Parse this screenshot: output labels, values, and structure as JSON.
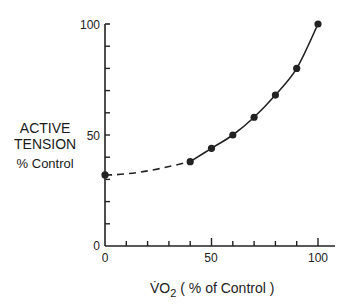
{
  "chart_data": {
    "type": "line",
    "title": "",
    "xlabel": "V̇O2 (% of Control)",
    "ylabel": "ACTIVE TENSION % Control",
    "xlim": [
      0,
      100
    ],
    "ylim": [
      0,
      100
    ],
    "x_ticks": [
      0,
      50,
      100
    ],
    "y_ticks": [
      0,
      50,
      100
    ],
    "grid": false,
    "series": [
      {
        "name": "Active tension vs VO2",
        "x": [
          0,
          40,
          50,
          60,
          70,
          80,
          90,
          100
        ],
        "y": [
          32,
          38,
          44,
          50,
          58,
          68,
          80,
          100
        ],
        "line_style": "dashed from 0 to 40, solid from 40 to 100",
        "marker": "filled circle"
      }
    ]
  },
  "labels": {
    "y_title_line1": "ACTIVE",
    "y_title_line2": "TENSION",
    "y_title_line3": "% Control",
    "x_title_main": "V̇O",
    "x_title_sub": "2",
    "x_title_rest": " ( % of Control )",
    "tick_y_100": "100",
    "tick_y_50": "50",
    "tick_y_0": "0",
    "tick_x_0": "0",
    "tick_x_50": "50",
    "tick_x_100": "100"
  }
}
